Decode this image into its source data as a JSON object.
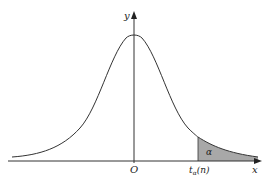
{
  "diagram": {
    "title": "",
    "type": "t-distribution density curve with upper tail area",
    "axes": {
      "x_label": "x",
      "y_label": "y",
      "origin_label": "O"
    },
    "critical_value_label": "t",
    "critical_value_subscript": "α",
    "critical_value_arg": "(n)",
    "tail_area_label": "α",
    "colors": {
      "curve": "#333333",
      "axes": "#333333",
      "shaded_tail": "#a8a8a8",
      "background": "#ffffff"
    }
  }
}
